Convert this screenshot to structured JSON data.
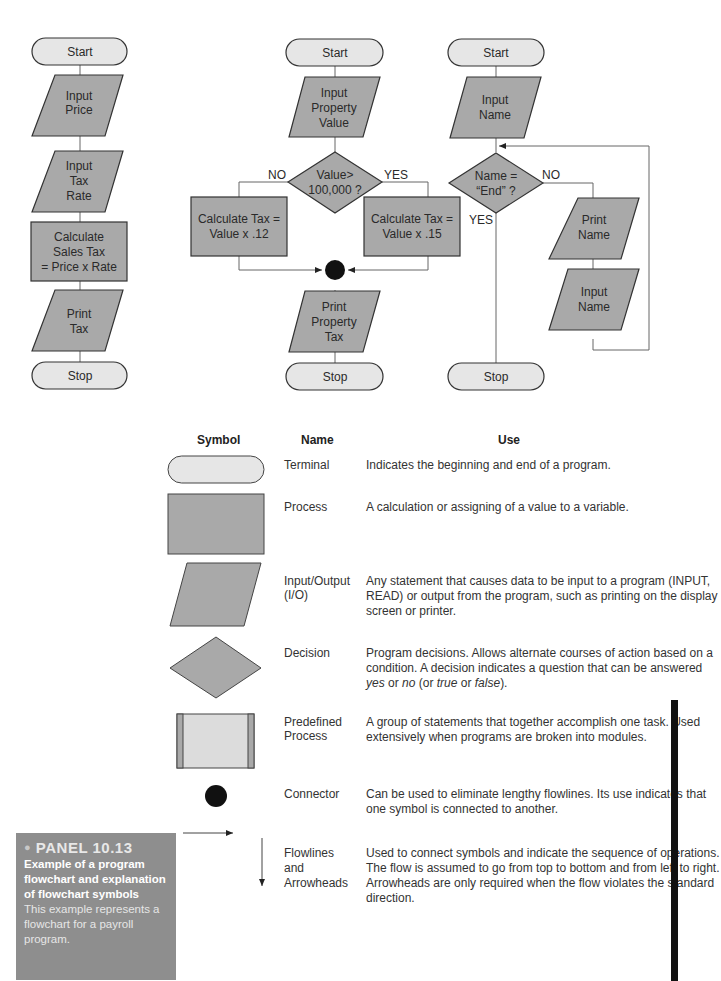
{
  "flowchart_1": {
    "nodes": [
      {
        "type": "terminal",
        "text": "Start"
      },
      {
        "type": "io",
        "lines": [
          "Input",
          "Price"
        ]
      },
      {
        "type": "io",
        "lines": [
          "Input",
          "Tax",
          "Rate"
        ]
      },
      {
        "type": "process",
        "lines": [
          "Calculate",
          "Sales Tax",
          "= Price x Rate"
        ]
      },
      {
        "type": "io",
        "lines": [
          "Print",
          "Tax"
        ]
      },
      {
        "type": "terminal",
        "text": "Stop"
      }
    ]
  },
  "flowchart_2": {
    "start": "Start",
    "input": [
      "Input",
      "Property",
      "Value"
    ],
    "decision": [
      "Value>",
      "100,000 ?"
    ],
    "no_label": "NO",
    "yes_label": "YES",
    "process_no": [
      "Calculate Tax =",
      "Value x .12"
    ],
    "process_yes": [
      "Calculate Tax =",
      "Value x .15"
    ],
    "output": [
      "Print",
      "Property",
      "Tax"
    ],
    "stop": "Stop"
  },
  "flowchart_3": {
    "start": "Start",
    "input": [
      "Input",
      "Name"
    ],
    "decision": [
      "Name =",
      "“End” ?"
    ],
    "no_label": "NO",
    "yes_label": "YES",
    "print": [
      "Print",
      "Name"
    ],
    "input_loop": [
      "Input",
      "Name"
    ],
    "stop": "Stop"
  },
  "legend": {
    "headers": {
      "symbol": "Symbol",
      "name": "Name",
      "use": "Use"
    },
    "rows": [
      {
        "symbol": "terminal",
        "name": [
          "Terminal"
        ],
        "use": "Indicates the beginning and end of a program."
      },
      {
        "symbol": "process",
        "name": [
          "Process"
        ],
        "use": "A calculation or assigning of a value to a variable."
      },
      {
        "symbol": "io",
        "name": [
          "Input/Output",
          "(I/O)"
        ],
        "use": "Any statement that causes data to be input to a program (INPUT, READ) or output from the program, such as printing on the display screen or printer."
      },
      {
        "symbol": "decision",
        "name": [
          "Decision"
        ],
        "use_parts": [
          "Program decisions. Allows alternate courses of action based on a condition. A decision indicates a question that can be answered ",
          "yes",
          " or ",
          "no",
          " (or ",
          "true",
          " or ",
          "false",
          ")."
        ]
      },
      {
        "symbol": "predefined-process",
        "name": [
          "Predefined",
          "Process"
        ],
        "use": "A group of statements that together accomplish one task. Used extensively when programs are broken into modules."
      },
      {
        "symbol": "connector",
        "name": [
          "Connector"
        ],
        "use": "Can be used to eliminate lengthy flowlines. Its use indicates that one symbol is connected to another."
      },
      {
        "symbol": "flowlines",
        "name": [
          "Flowlines",
          "and",
          "Arrowheads"
        ],
        "use": "Used to connect symbols and indicate the sequence of operations. The flow is assumed to go from top to bottom and from left to right. Arrowheads are only required when the flow violates the standard direction."
      }
    ]
  },
  "panel": {
    "title": "PANEL 10.13",
    "subtitle": "Example of a program flowchart and explanation of flowchart symbols",
    "body": "This example represents a flowchart for a payroll program."
  },
  "colors": {
    "shape_fill": "#a9a9a9",
    "terminal_fill": "#e6e6e6",
    "predefined_fill": "#dcdcdc",
    "stroke": "#333333",
    "line": "#666666",
    "panel_bg": "#8e8e8e"
  }
}
